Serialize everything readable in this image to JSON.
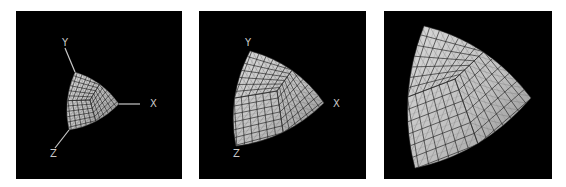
{
  "figure": {
    "colors": {
      "background": "#ffffff",
      "panel_background": "#000000",
      "surface_light": "#d8d8d8",
      "surface_dark": "#8a8a8a",
      "grid_line": "#2a2a2a",
      "tri_line": "#6a6a6a",
      "axis_color": "#c8c8c8"
    },
    "panels": [
      {
        "id": "panel-1",
        "left": 16,
        "width": 166,
        "axes_visible": true,
        "axes": [
          {
            "label": "Y",
            "line": [
              49,
              37,
              59,
              61
            ],
            "label_pos": [
              46,
              35
            ]
          },
          {
            "label": "X",
            "line": [
              103,
              93,
              124,
              93
            ],
            "label_pos": [
              134,
              96
            ]
          },
          {
            "label": "Z",
            "line": [
              53,
              119,
              39,
              137
            ],
            "label_pos": [
              34,
              146
            ]
          }
        ],
        "shape": {
          "tl": [
            59,
            61
          ],
          "r": [
            103,
            93
          ],
          "bl": [
            53,
            119
          ],
          "ctr": [
            74,
            89
          ],
          "scale": 1.0
        }
      },
      {
        "id": "panel-2",
        "left": 199,
        "width": 167,
        "axes_visible": true,
        "axes": [
          {
            "label": "Y",
            "line": null,
            "label_pos": [
              46,
              35
            ]
          },
          {
            "label": "X",
            "line": null,
            "label_pos": [
              134,
              96
            ]
          },
          {
            "label": "Z",
            "line": null,
            "label_pos": [
              34,
              146
            ]
          }
        ],
        "shape": {
          "tl": [
            51,
            40
          ],
          "r": [
            125,
            92
          ],
          "bl": [
            37,
            135
          ],
          "ctr": [
            78,
            80
          ],
          "scale": 1.0
        }
      },
      {
        "id": "panel-3",
        "left": 384,
        "width": 168,
        "axes_visible": false,
        "axes": [],
        "shape": {
          "tl": [
            40,
            15
          ],
          "r": [
            147,
            87
          ],
          "bl": [
            31,
            157
          ],
          "ctr": [
            71,
            68
          ],
          "scale": 1.0
        }
      }
    ]
  }
}
